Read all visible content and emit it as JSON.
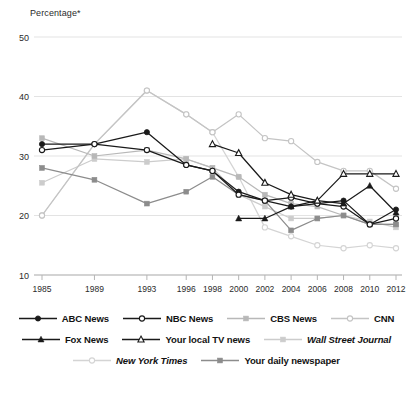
{
  "axis_title": "Percentage*",
  "chart_data": {
    "type": "line",
    "title": "",
    "xlabel": "",
    "ylabel": "Percentage*",
    "ylim": [
      10,
      50
    ],
    "yticks": [
      10,
      20,
      30,
      40,
      50
    ],
    "grid": true,
    "legend_position": "bottom",
    "x": [
      1985,
      1989,
      1993,
      1996,
      1998,
      2000,
      2002,
      2004,
      2006,
      2008,
      2010,
      2012
    ],
    "categories": [
      "1985",
      "1989",
      "1993",
      "1996",
      "1998",
      "2000",
      "2002",
      "2004",
      "2006",
      "2008",
      "2010",
      "2012"
    ],
    "series": [
      {
        "name": "ABC News",
        "marker": "filled-circle",
        "color": "#1a1a1a",
        "x": [
          1985,
          1989,
          1993,
          1996,
          1998,
          2000,
          2002,
          2004,
          2006,
          2008,
          2010,
          2012
        ],
        "values": [
          32.0,
          32.0,
          34.0,
          28.5,
          27.5,
          24.0,
          22.5,
          21.5,
          22.0,
          22.5,
          18.5,
          21.0
        ]
      },
      {
        "name": "NBC News",
        "marker": "open-circle",
        "color": "#1a1a1a",
        "x": [
          1985,
          1989,
          1993,
          1996,
          1998,
          2000,
          2002,
          2004,
          2006,
          2008,
          2010,
          2012
        ],
        "values": [
          31.0,
          32.0,
          31.0,
          28.5,
          27.5,
          23.5,
          22.5,
          23.0,
          22.0,
          21.5,
          18.5,
          19.5
        ]
      },
      {
        "name": "CBS News",
        "marker": "filled-square",
        "color": "#b8b8b8",
        "x": [
          1985,
          1989,
          1993,
          1996,
          1998,
          2000,
          2002,
          2004,
          2006,
          2008,
          2010,
          2012
        ],
        "values": [
          33.0,
          30.0,
          31.0,
          29.5,
          28.0,
          26.5,
          23.5,
          22.0,
          21.5,
          20.0,
          18.5,
          18.5
        ]
      },
      {
        "name": "CNN",
        "marker": "open-circle",
        "color": "#c4c4c4",
        "x": [
          1985,
          1989,
          1993,
          1996,
          1998,
          2000,
          2002,
          2004,
          2006,
          2008,
          2010,
          2012
        ],
        "values": [
          20.0,
          32.0,
          41.0,
          37.0,
          34.0,
          37.0,
          33.0,
          32.5,
          29.0,
          27.5,
          27.5,
          24.5
        ]
      },
      {
        "name": "Fox News",
        "marker": "filled-triangle",
        "color": "#1a1a1a",
        "x": [
          2000,
          2002,
          2004,
          2006,
          2008,
          2010,
          2012
        ],
        "values": [
          19.5,
          19.5,
          21.5,
          22.5,
          22.0,
          25.0,
          20.5
        ]
      },
      {
        "name": "Your local TV news",
        "marker": "open-triangle",
        "color": "#1a1a1a",
        "x": [
          1998,
          2000,
          2002,
          2004,
          2006,
          2008,
          2010,
          2012
        ],
        "values": [
          32.0,
          30.5,
          25.5,
          23.5,
          22.5,
          27.0,
          27.0,
          27.0
        ]
      },
      {
        "name": "Wall Street Journal",
        "marker": "filled-square",
        "color": "#cccccc",
        "x": [
          1985,
          1989,
          1993,
          1996,
          1998,
          2000,
          2002,
          2004,
          2006,
          2008,
          2010,
          2012
        ],
        "values": [
          25.5,
          29.5,
          29.0,
          29.5,
          28.0,
          23.5,
          21.5,
          19.5,
          19.5,
          20.0,
          19.0,
          18.0
        ]
      },
      {
        "name": "New York Times",
        "marker": "open-circle",
        "color": "#d4d4d4",
        "x": [
          1985,
          1989,
          1993,
          1996,
          1998,
          2000,
          2002,
          2004,
          2006,
          2008,
          2010,
          2012
        ],
        "values": [
          20.0,
          32.0,
          41.0,
          37.0,
          34.0,
          26.5,
          18.0,
          16.5,
          15.0,
          14.5,
          15.0,
          14.5
        ]
      },
      {
        "name": "Your daily newspaper",
        "marker": "filled-square",
        "color": "#8c8c8c",
        "x": [
          1985,
          1989,
          1993,
          1996,
          1998,
          2000,
          2002,
          2004,
          2006,
          2008,
          2010,
          2012
        ],
        "values": [
          28.0,
          26.0,
          22.0,
          24.0,
          26.5,
          23.5,
          22.5,
          17.5,
          19.5,
          20.0,
          18.5,
          18.5
        ]
      }
    ]
  },
  "legend": {
    "rows": [
      [
        {
          "label": "ABC News",
          "marker": "filled-circle",
          "color": "#1a1a1a",
          "italic": false
        },
        {
          "label": "NBC News",
          "marker": "open-circle",
          "color": "#1a1a1a",
          "italic": false
        },
        {
          "label": "CBS News",
          "marker": "filled-square",
          "color": "#b8b8b8",
          "italic": false
        },
        {
          "label": "CNN",
          "marker": "open-circle",
          "color": "#c4c4c4",
          "italic": false
        }
      ],
      [
        {
          "label": "Fox News",
          "marker": "filled-triangle",
          "color": "#1a1a1a",
          "italic": false
        },
        {
          "label": "Your local TV news",
          "marker": "open-triangle",
          "color": "#1a1a1a",
          "italic": false
        },
        {
          "label": "Wall Street Journal",
          "marker": "filled-square",
          "color": "#cccccc",
          "italic": true
        }
      ],
      [
        {
          "label": "New York Times",
          "marker": "open-circle",
          "color": "#d4d4d4",
          "italic": true
        },
        {
          "label": "Your daily newspaper",
          "marker": "filled-square",
          "color": "#8c8c8c",
          "italic": false
        }
      ]
    ]
  },
  "colors": {
    "gridline": "#e3e3e3",
    "axis": "#b5b5b5",
    "text": "#2b2b2b"
  }
}
